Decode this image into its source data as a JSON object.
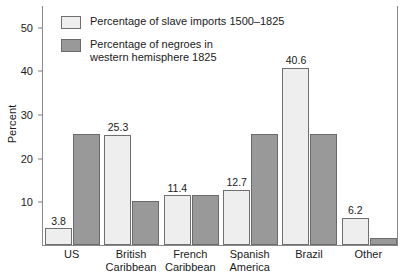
{
  "chart_data": {
    "type": "bar",
    "title": "",
    "xlabel": "",
    "ylabel": "Percent",
    "ylim": [
      0,
      55
    ],
    "yticks": [
      10,
      20,
      30,
      40,
      50
    ],
    "grid": false,
    "legend_position": "top-left inside plot area",
    "categories": [
      "US",
      "British\nCaribbean",
      "French\nCaribbean",
      "Spanish\nAmerica",
      "Brazil",
      "Other"
    ],
    "series": [
      {
        "name": "Percentage of slave imports 1500–1825",
        "color": "#eeeeee",
        "values": [
          3.8,
          25.3,
          11.4,
          12.7,
          40.6,
          6.2
        ],
        "labels": [
          "3.8",
          "25.3",
          "11.4",
          "12.7",
          "40.6",
          "6.2"
        ]
      },
      {
        "name": "Percentage of negroes in\nwestern hemisphere 1825",
        "color": "#999999",
        "values": [
          25.5,
          10.0,
          11.4,
          25.5,
          25.5,
          1.7
        ],
        "labels": [
          "",
          "",
          "",
          "",
          "",
          ""
        ]
      }
    ]
  },
  "legend": {
    "items": [
      {
        "label": "Percentage of slave imports 1500–1825",
        "swatch": "light"
      },
      {
        "label": "Percentage of negroes in\nwestern hemisphere 1825",
        "swatch": "dark"
      }
    ]
  },
  "caption": {
    "text": ""
  }
}
